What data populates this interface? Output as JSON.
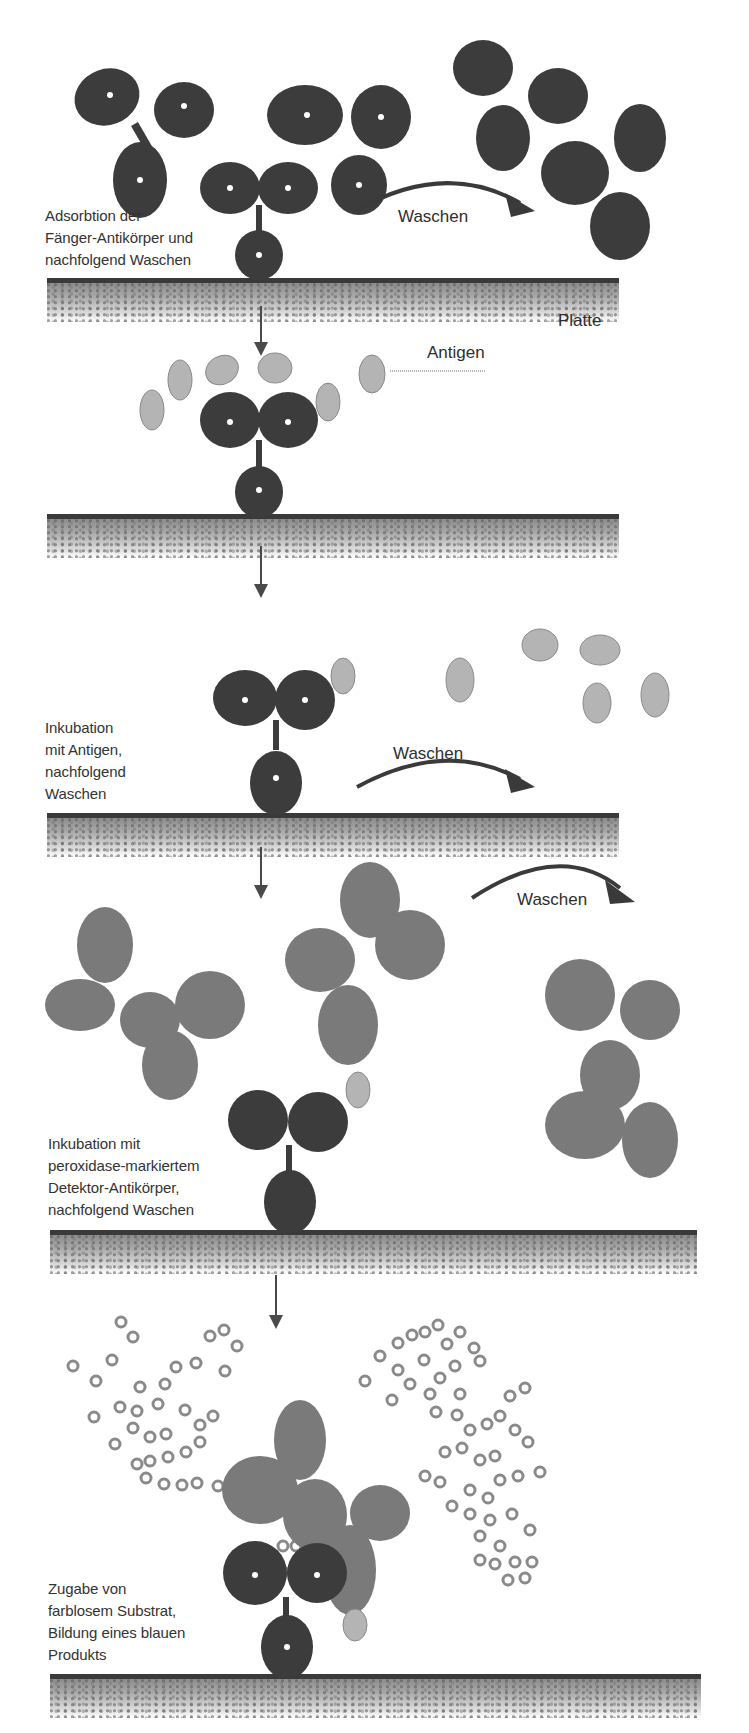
{
  "figure": {
    "type": "sandwich-elisa-steps",
    "colors": {
      "capture_antibody": "#3c3c3c",
      "detection_antibody": "#7a7a7a",
      "antigen": "#b4b4b4",
      "substrate_product": "#8a8a8a",
      "plate_edge": "#3a3a3a",
      "arrow": "#4a4a4a"
    }
  },
  "steps": [
    {
      "id": 1,
      "label_lines": [
        "Adsorbtion der",
        "Fänger-Antikörper und",
        "nachfolgend Waschen"
      ],
      "wash_label": "Waschen",
      "plate_label": "Platte"
    },
    {
      "id": 2,
      "antigen_label": "Antigen"
    },
    {
      "id": 3,
      "label_lines": [
        "Inkubation",
        "mit Antigen,",
        "nachfolgend",
        "Waschen"
      ],
      "wash_label": "Waschen"
    },
    {
      "id": 4,
      "label_lines": [
        "Inkubation mit",
        "peroxidase-markiertem",
        "Detektor-Antikörper,",
        "nachfolgend Waschen"
      ],
      "wash_label": "Waschen"
    },
    {
      "id": 5,
      "label_lines": [
        "Zugabe von",
        "farblosem Substrat,",
        "Bildung eines blauen",
        "Produkts"
      ]
    }
  ]
}
